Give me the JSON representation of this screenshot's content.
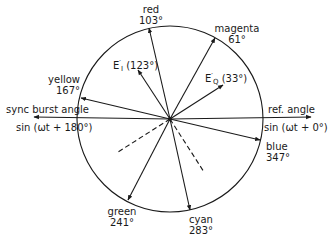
{
  "diagram": {
    "type": "phasor",
    "center": {
      "x": 170,
      "y": 119
    },
    "radius": 93,
    "stroke_color": "#1a1a1a",
    "reference": {
      "ref_angle_label": "ref. angle",
      "ref_angle_formula": "sin (ωt + 0°)",
      "sync_label": "sync burst angle",
      "sync_formula": "sin (ωt + 180°)"
    },
    "color_vectors": [
      {
        "name": "red",
        "angle": "103°",
        "deg": 103
      },
      {
        "name": "magenta",
        "angle": "61°",
        "deg": 61
      },
      {
        "name": "yellow",
        "angle": "167°",
        "deg": 167
      },
      {
        "name": "blue",
        "angle": "347°",
        "deg": 347
      },
      {
        "name": "green",
        "angle": "241°",
        "deg": 241
      },
      {
        "name": "cyan",
        "angle": "283°",
        "deg": 283
      }
    ],
    "signal_vectors": [
      {
        "name": "E",
        "prime": "′",
        "subscript": "I",
        "angle": "(123°)",
        "deg": 123
      },
      {
        "name": "E",
        "prime": "′",
        "subscript": "Q",
        "angle": "(33°)",
        "deg": 33
      }
    ],
    "dashed_lines": [
      {
        "deg": 213
      },
      {
        "deg": 303
      }
    ]
  }
}
